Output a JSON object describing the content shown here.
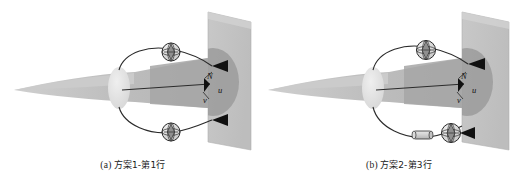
{
  "figure": {
    "type": "technical-diagram",
    "background_color": "#ffffff",
    "panel_count": 2
  },
  "colors": {
    "wall_light": "#c9c9c9",
    "wall_shadow": "#a9a9a9",
    "blade_light": "#bfbfbf",
    "blade_dark": "#9a9a9a",
    "blade_tip": "#c4c4c4",
    "hub_ellipse": "#e4e4e4",
    "line_stroke": "#2b2b2b",
    "arrow_fill": "#111111",
    "marker_fill": "#d8d8d8",
    "caption_text": "#1a1a1a"
  },
  "panels": [
    {
      "id": "a",
      "caption_index": "(a)",
      "caption_text": "方案1-第1行",
      "labels": {
        "normal": "N",
        "v_component": "v",
        "u_component": "u"
      },
      "markers": [
        {
          "name": "upper-crosshair-sphere",
          "type": "crosshair-sphere"
        },
        {
          "name": "lower-crosshair-sphere",
          "type": "crosshair-sphere"
        }
      ],
      "arrows": [
        {
          "name": "upper-wall-arrow",
          "direction": "left"
        },
        {
          "name": "lower-wall-arrow",
          "direction": "left"
        },
        {
          "name": "axis-arrow",
          "direction": "right"
        }
      ],
      "has_cylinder_element": false
    },
    {
      "id": "b",
      "caption_index": "(b)",
      "caption_text": "方案2-第3行",
      "labels": {
        "normal": "N",
        "v_component": "v",
        "u_component": "u"
      },
      "markers": [
        {
          "name": "upper-crosshair-sphere",
          "type": "crosshair-sphere"
        },
        {
          "name": "lower-crosshair-sphere",
          "type": "crosshair-sphere"
        },
        {
          "name": "lower-cylinder",
          "type": "cylinder"
        }
      ],
      "arrows": [
        {
          "name": "upper-wall-arrow",
          "direction": "left"
        },
        {
          "name": "lower-wall-arrow",
          "direction": "left"
        },
        {
          "name": "axis-arrow",
          "direction": "right"
        }
      ],
      "has_cylinder_element": true
    }
  ]
}
